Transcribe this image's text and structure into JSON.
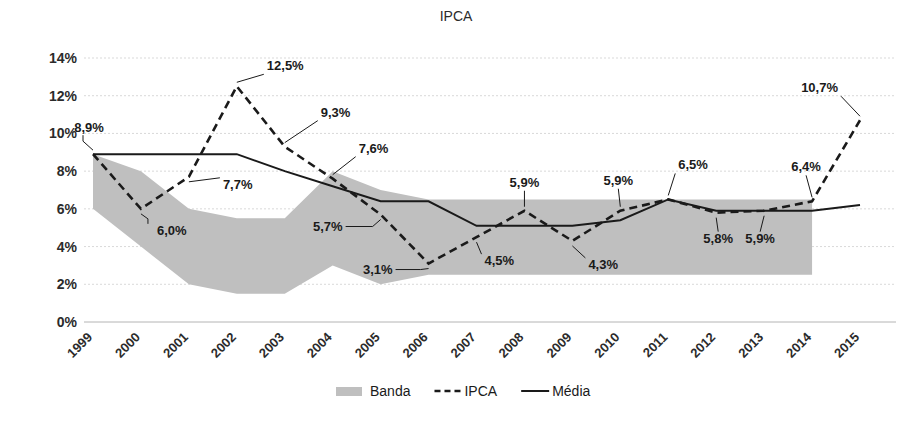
{
  "chart_data": {
    "type": "line",
    "title": "IPCA",
    "xlabel": "",
    "ylabel": "",
    "ylim": [
      0,
      14
    ],
    "ytick_labels": [
      "0%",
      "2%",
      "4%",
      "6%",
      "8%",
      "10%",
      "12%",
      "14%"
    ],
    "yticks": [
      0,
      2,
      4,
      6,
      8,
      10,
      12,
      14
    ],
    "grid": true,
    "legend_position": "bottom",
    "categories": [
      "1999",
      "2000",
      "2001",
      "2002",
      "2003",
      "2004",
      "2005",
      "2006",
      "2007",
      "2008",
      "2009",
      "2010",
      "2011",
      "2012",
      "2013",
      "2014",
      "2015"
    ],
    "series": [
      {
        "name": "Banda",
        "type": "area",
        "upper": [
          8.9,
          8.0,
          6.0,
          5.5,
          5.5,
          8.0,
          7.0,
          6.5,
          6.5,
          6.5,
          6.5,
          6.5,
          6.5,
          6.5,
          6.5,
          6.5,
          null
        ],
        "lower": [
          6.0,
          4.0,
          2.0,
          1.5,
          1.5,
          3.0,
          2.0,
          2.5,
          2.5,
          2.5,
          2.5,
          2.5,
          2.5,
          2.5,
          2.5,
          2.5,
          null
        ]
      },
      {
        "name": "IPCA",
        "type": "line-dashed",
        "values": [
          8.9,
          6.0,
          7.7,
          12.5,
          9.3,
          7.6,
          5.7,
          3.1,
          4.5,
          5.9,
          4.3,
          5.9,
          6.5,
          5.8,
          5.9,
          6.4,
          10.7
        ]
      },
      {
        "name": "Média",
        "type": "line-solid",
        "values": [
          8.9,
          8.9,
          8.9,
          8.9,
          8.0,
          7.2,
          6.4,
          6.4,
          5.1,
          5.1,
          5.1,
          5.4,
          6.5,
          5.9,
          5.9,
          5.9,
          6.2
        ]
      }
    ],
    "data_labels": [
      {
        "text": "8,9%",
        "year": "1999",
        "value": 8.9
      },
      {
        "text": "6,0%",
        "year": "2000",
        "value": 6.0
      },
      {
        "text": "7,7%",
        "year": "2001",
        "value": 7.7
      },
      {
        "text": "12,5%",
        "year": "2002",
        "value": 12.5
      },
      {
        "text": "9,3%",
        "year": "2003",
        "value": 9.3
      },
      {
        "text": "7,6%",
        "year": "2004",
        "value": 7.6
      },
      {
        "text": "5,7%",
        "year": "2005",
        "value": 5.7
      },
      {
        "text": "3,1%",
        "year": "2006",
        "value": 3.1
      },
      {
        "text": "4,5%",
        "year": "2007",
        "value": 4.5
      },
      {
        "text": "5,9%",
        "year": "2008",
        "value": 5.9
      },
      {
        "text": "4,3%",
        "year": "2009",
        "value": 4.3
      },
      {
        "text": "5,9%",
        "year": "2010",
        "value": 5.9
      },
      {
        "text": "6,5%",
        "year": "2011",
        "value": 6.5
      },
      {
        "text": "5,8%",
        "year": "2012",
        "value": 5.8
      },
      {
        "text": "5,9%",
        "year": "2013",
        "value": 5.9
      },
      {
        "text": "6,4%",
        "year": "2014",
        "value": 6.4
      },
      {
        "text": "10,7%",
        "year": "2015",
        "value": 10.7
      }
    ],
    "legend": [
      {
        "label": "Banda",
        "marker": "swatch",
        "color": "#bfbfbf"
      },
      {
        "label": "IPCA",
        "marker": "dashed-line",
        "color": "#1a1a1a"
      },
      {
        "label": "Média",
        "marker": "solid-line",
        "color": "#1a1a1a"
      }
    ],
    "colors": {
      "band": "#bfbfbf",
      "ipca": "#1a1a1a",
      "media": "#1a1a1a",
      "grid": "#d9d9d9",
      "axis": "#b4b4b4",
      "text": "#1a1a1a"
    }
  }
}
